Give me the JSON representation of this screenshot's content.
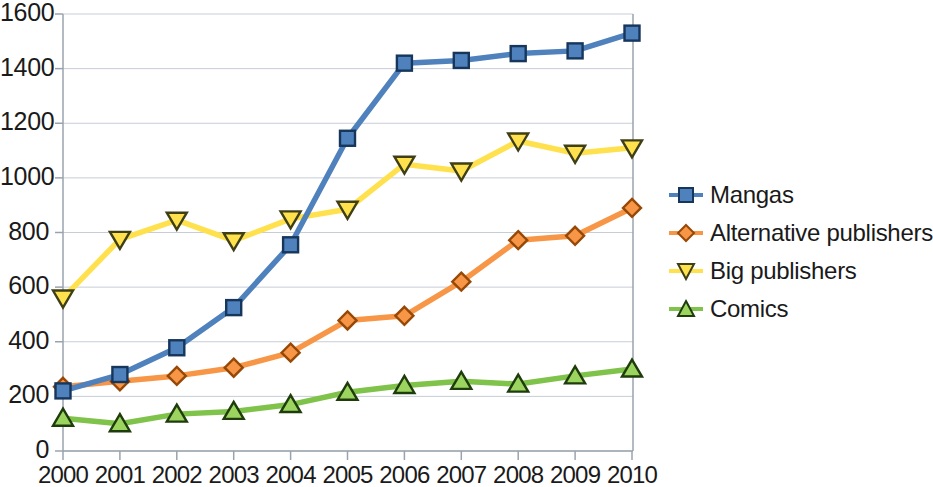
{
  "chart_data": {
    "type": "line",
    "title": "",
    "xlabel": "",
    "ylabel": "",
    "grid": true,
    "legend_position": "right",
    "xlim": [
      2000,
      2010
    ],
    "ylim": [
      0,
      1600
    ],
    "ytick_step": 200,
    "categories": [
      "2000",
      "2001",
      "2002",
      "2003",
      "2004",
      "2005",
      "2006",
      "2007",
      "2008",
      "2009",
      "2010"
    ],
    "x": [
      2000,
      2001,
      2002,
      2003,
      2004,
      2005,
      2006,
      2007,
      2008,
      2009,
      2010
    ],
    "yticks": [
      "0",
      "200",
      "400",
      "600",
      "800",
      "1000",
      "1200",
      "1400",
      "1600"
    ],
    "series": [
      {
        "name": "Mangas",
        "color": "#4f81bd",
        "marker": "square",
        "values": [
          220,
          280,
          378,
          525,
          755,
          1145,
          1420,
          1430,
          1455,
          1465,
          1530
        ]
      },
      {
        "name": "Alternative publishers",
        "color": "#f79646",
        "marker": "diamond",
        "values": [
          235,
          255,
          275,
          305,
          360,
          478,
          495,
          620,
          772,
          788,
          890
        ]
      },
      {
        "name": "Big publishers",
        "color": "#ffe14d",
        "marker": "triangle-down",
        "values": [
          560,
          775,
          845,
          770,
          850,
          885,
          1050,
          1025,
          1135,
          1090,
          1110
        ]
      },
      {
        "name": "Comics",
        "color": "#7fc34a",
        "marker": "triangle-up",
        "values": [
          120,
          100,
          135,
          145,
          170,
          215,
          240,
          255,
          245,
          275,
          300
        ]
      }
    ]
  },
  "legend": {
    "items": [
      {
        "label": "Mangas"
      },
      {
        "label": "Alternative publishers"
      },
      {
        "label": "Big publishers"
      },
      {
        "label": "Comics"
      }
    ]
  },
  "axes": {
    "y_labels": [
      "1600",
      "1400",
      "1200",
      "1000",
      "800",
      "600",
      "400",
      "200",
      "0"
    ],
    "x_labels": [
      "2000",
      "2001",
      "2002",
      "2003",
      "2004",
      "2005",
      "2006",
      "2007",
      "2008",
      "2009",
      "2010"
    ]
  },
  "colors": {
    "mangas": "#4f81bd",
    "alternative_publishers": "#f79646",
    "big_publishers": "#ffe14d",
    "comics": "#7fc34a",
    "grid": "#c7cdd6",
    "axis": "#9aa3ad",
    "text": "#1a1a1a"
  }
}
